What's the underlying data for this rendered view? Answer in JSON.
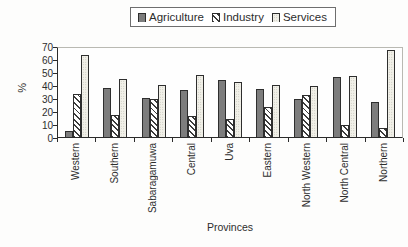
{
  "chart_data": {
    "type": "bar",
    "title": "",
    "xlabel": "Provinces",
    "ylabel": "%",
    "ylim": [
      0,
      70
    ],
    "yticks": [
      0,
      10,
      20,
      30,
      40,
      50,
      60,
      70
    ],
    "grid": false,
    "legend_position": "top-center",
    "categories": [
      "Western",
      "Southern",
      "Sabaragamuwa",
      "Central",
      "Uva",
      "Eastern",
      "North Western",
      "North Central",
      "Northern"
    ],
    "series": [
      {
        "name": "Agriculture",
        "style": "solid-dark-gray",
        "values": [
          5,
          38,
          30,
          36,
          44,
          37,
          29,
          46,
          27
        ]
      },
      {
        "name": "Industry",
        "style": "diagonal-hatch",
        "values": [
          33,
          17,
          29,
          16,
          14,
          23,
          32,
          9,
          7
        ]
      },
      {
        "name": "Services",
        "style": "light-dotted",
        "values": [
          63,
          45,
          40,
          48,
          42,
          40,
          39,
          47,
          67
        ]
      }
    ],
    "colors": {
      "agriculture_fill": "#7d7d7d",
      "industry_hatch": "#3c3c3c",
      "services_fill": "#f1f0e8",
      "axis": "#2b2b2b"
    }
  }
}
